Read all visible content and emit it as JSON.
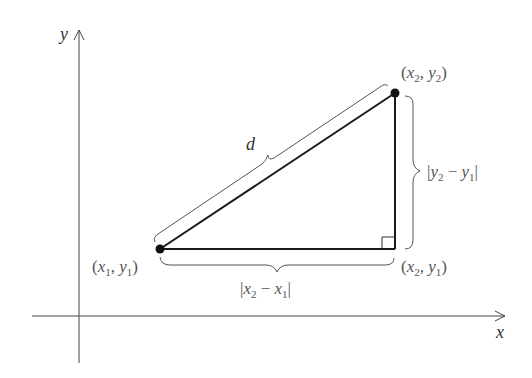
{
  "diagram": {
    "axes": {
      "x_label": "x",
      "y_label": "y"
    },
    "points": {
      "p1": {
        "label_open": "(",
        "var1": "x",
        "sub1": "1",
        "sep": ", ",
        "var2": "y",
        "sub2": "1",
        "label_close": ")"
      },
      "p2": {
        "label_open": "(",
        "var1": "x",
        "sub1": "2",
        "sep": ", ",
        "var2": "y",
        "sub2": "2",
        "label_close": ")"
      },
      "corner": {
        "label_open": "(",
        "var1": "x",
        "sub1": "2",
        "sep": ", ",
        "var2": "y",
        "sub2": "1",
        "label_close": ")"
      }
    },
    "hypotenuse_label": "d",
    "horizontal_label": {
      "bar_l": "|",
      "var1": "x",
      "sub1": "2",
      "op": " − ",
      "var2": "x",
      "sub2": "1",
      "bar_r": "|"
    },
    "vertical_label": {
      "bar_l": "|",
      "var1": "y",
      "sub1": "2",
      "op": " − ",
      "var2": "y",
      "sub2": "1",
      "bar_r": "|"
    },
    "colors": {
      "line": "#1a1a1a",
      "axis": "#444444",
      "brace": "#555555",
      "label": "#555555"
    }
  }
}
